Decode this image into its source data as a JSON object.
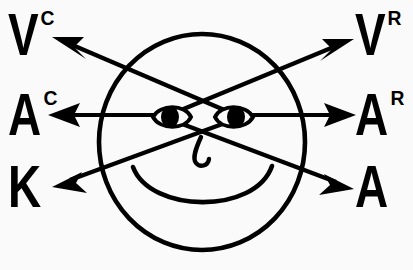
{
  "diagram": {
    "background_color": "#fafafa",
    "ink_color": "#000000",
    "face": {
      "description": "smiley face with two eyes, hooked nose and smiling mouth",
      "circle_center_x": 202,
      "circle_center_y": 142,
      "circle_radius_x": 103,
      "circle_radius_y": 108,
      "left_eye_x": 172,
      "left_eye_y": 117,
      "right_eye_x": 233,
      "right_eye_y": 117
    },
    "labels": {
      "visual_constructed": {
        "glyph": "V",
        "superscript": "C",
        "position": "upper-left"
      },
      "auditory_constructed": {
        "glyph": "A",
        "superscript": "C",
        "position": "middle-left"
      },
      "kinesthetic": {
        "glyph": "K",
        "superscript": "",
        "position": "lower-left"
      },
      "visual_remembered": {
        "glyph": "V",
        "superscript": "R",
        "position": "upper-right"
      },
      "auditory_remembered": {
        "glyph": "A",
        "superscript": "R",
        "position": "middle-right"
      },
      "auditory_digital": {
        "glyph": "A",
        "superscript": "",
        "position": "lower-right"
      }
    },
    "arrows": [
      {
        "name": "arrow-to-visual-constructed",
        "from_eye": "right",
        "to_label": "visual_constructed",
        "direction": "up-left"
      },
      {
        "name": "arrow-to-auditory-constructed",
        "from_eye": "left",
        "to_label": "auditory_constructed",
        "direction": "left"
      },
      {
        "name": "arrow-to-kinesthetic",
        "from_eye": "right",
        "to_label": "kinesthetic",
        "direction": "down-left"
      },
      {
        "name": "arrow-to-visual-remembered",
        "from_eye": "left",
        "to_label": "visual_remembered",
        "direction": "up-right"
      },
      {
        "name": "arrow-to-auditory-remembered",
        "from_eye": "right",
        "to_label": "auditory_remembered",
        "direction": "right"
      },
      {
        "name": "arrow-to-auditory-digital",
        "from_eye": "left",
        "to_label": "auditory_digital",
        "direction": "down-right"
      }
    ]
  }
}
